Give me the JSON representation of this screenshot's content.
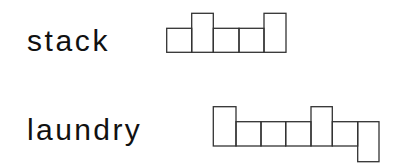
{
  "items": [
    {
      "word": "stack",
      "shape": {
        "description": "word-shape boxes: one box per letter, tall for ascenders, short for x-height, descending for descenders",
        "boxes": [
          {
            "letter": "s",
            "type": "short",
            "x": 166.7,
            "w": 25.0,
            "top": 28.3,
            "bottom": 52.3
          },
          {
            "letter": "t",
            "type": "tall",
            "x": 191.7,
            "w": 21.6,
            "top": 13.3,
            "bottom": 52.3
          },
          {
            "letter": "a",
            "type": "short",
            "x": 213.3,
            "w": 25.7,
            "top": 28.3,
            "bottom": 52.3
          },
          {
            "letter": "c",
            "type": "short",
            "x": 239.0,
            "w": 25.0,
            "top": 28.3,
            "bottom": 52.3
          },
          {
            "letter": "k",
            "type": "tall",
            "x": 264.0,
            "w": 22.0,
            "top": 13.3,
            "bottom": 52.3
          }
        ]
      }
    },
    {
      "word": "laundry",
      "shape": {
        "description": "word-shape boxes: one box per letter, tall for ascenders, short for x-height, descending for descenders",
        "boxes": [
          {
            "letter": "l",
            "type": "tall",
            "x": 213.3,
            "w": 22.7,
            "top": 106.7,
            "bottom": 146.0
          },
          {
            "letter": "a",
            "type": "short",
            "x": 236.0,
            "w": 25.0,
            "top": 121.7,
            "bottom": 146.0
          },
          {
            "letter": "u",
            "type": "short",
            "x": 261.0,
            "w": 24.7,
            "top": 121.7,
            "bottom": 146.0
          },
          {
            "letter": "n",
            "type": "short",
            "x": 285.7,
            "w": 25.3,
            "top": 121.7,
            "bottom": 146.0
          },
          {
            "letter": "d",
            "type": "tall",
            "x": 311.0,
            "w": 21.3,
            "top": 106.7,
            "bottom": 146.0
          },
          {
            "letter": "r",
            "type": "short",
            "x": 332.3,
            "w": 25.4,
            "top": 121.7,
            "bottom": 146.0
          },
          {
            "letter": "y",
            "type": "descender",
            "x": 357.7,
            "w": 21.3,
            "top": 121.7,
            "bottom": 161.7
          }
        ]
      }
    }
  ],
  "colors": {
    "text": "#111111",
    "stroke": "#333333",
    "background": "#ffffff"
  }
}
